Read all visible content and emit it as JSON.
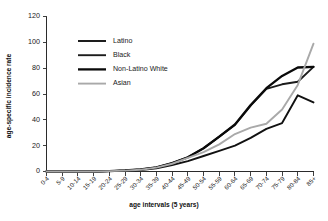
{
  "chart_data": {
    "type": "line",
    "title": "",
    "xlabel": "age intervals (5 years)",
    "ylabel": "age-specific incidence rate",
    "categories": [
      "0-4",
      "5-9",
      "10-14",
      "15-19",
      "20-24",
      "25-29",
      "30-34",
      "35-39",
      "40-44",
      "45-49",
      "50-54",
      "55-59",
      "60-64",
      "65-69",
      "70-74",
      "75-79",
      "80-84",
      "85+"
    ],
    "ylim": [
      0,
      120
    ],
    "yticks": [
      0,
      20,
      40,
      60,
      80,
      100,
      120
    ],
    "grid": false,
    "legend_position": "upper-left-inside",
    "series": [
      {
        "name": "Latino",
        "color": "#111111",
        "values": [
          0,
          0,
          0,
          0,
          0.3,
          0.6,
          1.2,
          2.5,
          5.0,
          8.0,
          12.0,
          16.0,
          20.0,
          26.0,
          33.0,
          37.5,
          59.0,
          53.5
        ]
      },
      {
        "name": "Black",
        "color": "#1c1c1c",
        "values": [
          0,
          0,
          0,
          0,
          0.3,
          0.8,
          1.6,
          3.2,
          6.5,
          11.0,
          18.0,
          27.0,
          36.0,
          51.0,
          64.0,
          67.5,
          69.5,
          81.0
        ]
      },
      {
        "name": "Non-Latino White",
        "color": "#0a0a0a",
        "values": [
          0,
          0,
          0,
          0,
          0.3,
          0.8,
          1.6,
          3.2,
          6.5,
          11.0,
          18.0,
          27.0,
          36.5,
          51.5,
          64.5,
          74.0,
          80.5,
          81.0
        ]
      },
      {
        "name": "Asian",
        "color": "#a9a9a9",
        "values": [
          0,
          0,
          0,
          0,
          0.3,
          0.7,
          1.4,
          3.0,
          6.0,
          10.5,
          15.0,
          21.0,
          29.0,
          34.0,
          37.0,
          48.0,
          67.0,
          99.0
        ]
      }
    ]
  },
  "legend": {
    "items": [
      {
        "label": "Latino"
      },
      {
        "label": "Black"
      },
      {
        "label": "Non-Latino White"
      },
      {
        "label": "Asian"
      }
    ]
  },
  "axes": {
    "y_title": "age-specific incidence rate",
    "x_title": "age intervals (5 years)",
    "y_tick_labels": [
      "0",
      "20",
      "40",
      "60",
      "80",
      "100",
      "120"
    ],
    "x_tick_labels": [
      "0-4",
      "5-9",
      "10-14",
      "15-19",
      "20-24",
      "25-29",
      "30-34",
      "35-39",
      "40-44",
      "45-49",
      "50-54",
      "55-59",
      "60-64",
      "65-69",
      "70-74",
      "75-79",
      "80-84",
      "85+"
    ]
  }
}
